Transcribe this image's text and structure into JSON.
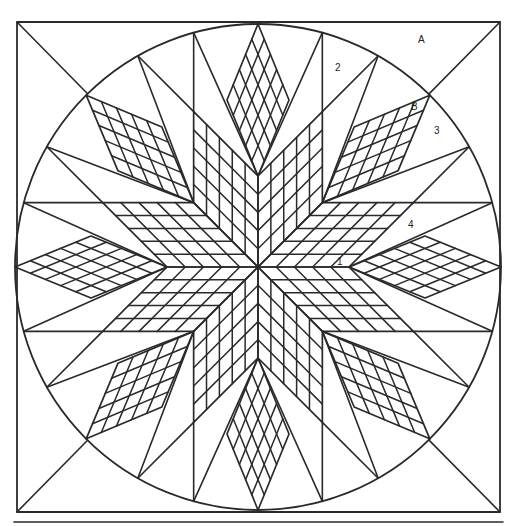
{
  "diagram": {
    "colors": {
      "stroke": "#2a2a2a",
      "background": "#ffffff"
    },
    "geometry": {
      "center": [
        258,
        267
      ],
      "circle_radius": 243,
      "square": {
        "x1": 17,
        "y1": 22,
        "x2": 500,
        "y2": 512
      },
      "baseline": {
        "x1": 14,
        "x2": 503,
        "y": 522
      },
      "lone_star": {
        "arms": 8,
        "arm_length": 91,
        "grid": 5
      },
      "outer_diamonds": {
        "count": 8,
        "inner_radius": 91,
        "outer_radius": 243,
        "half_width": 31,
        "grid": 5
      }
    },
    "labels": [
      {
        "id": "A",
        "text": "A",
        "x": 418,
        "y": 35
      },
      {
        "id": "2",
        "text": "2",
        "x": 335,
        "y": 63
      },
      {
        "id": "B",
        "text": "B",
        "x": 411,
        "y": 102
      },
      {
        "id": "3",
        "text": "3",
        "x": 434,
        "y": 126
      },
      {
        "id": "4",
        "text": "4",
        "x": 408,
        "y": 220
      },
      {
        "id": "1",
        "text": "1",
        "x": 337,
        "y": 257
      }
    ]
  }
}
